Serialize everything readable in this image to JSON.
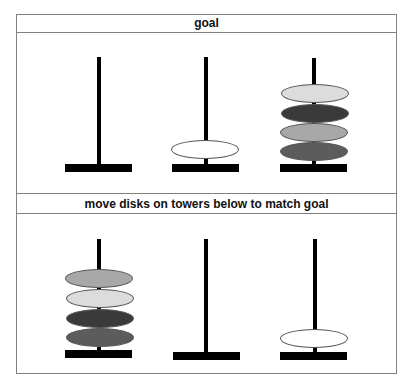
{
  "goal_panel": {
    "title": "goal",
    "towers": [
      {
        "label": "goal-tower-1",
        "disks": []
      },
      {
        "label": "goal-tower-2",
        "disks": [
          {
            "color": "#ffffff",
            "name": "white"
          }
        ]
      },
      {
        "label": "goal-tower-3",
        "disks": [
          {
            "color": "#dcdcdc",
            "name": "light-gray"
          },
          {
            "color": "#3a3a3a",
            "name": "dark-gray"
          },
          {
            "color": "#a8a8a8",
            "name": "medium-gray"
          },
          {
            "color": "#5c5c5c",
            "name": "charcoal"
          }
        ]
      }
    ]
  },
  "play_panel": {
    "title": "move disks on towers below to match goal",
    "towers": [
      {
        "label": "tower-1",
        "disks": [
          {
            "color": "#a8a8a8",
            "name": "medium-gray"
          },
          {
            "color": "#dcdcdc",
            "name": "light-gray"
          },
          {
            "color": "#3a3a3a",
            "name": "dark-gray"
          },
          {
            "color": "#5c5c5c",
            "name": "charcoal"
          }
        ]
      },
      {
        "label": "tower-2",
        "disks": []
      },
      {
        "label": "tower-3",
        "disks": [
          {
            "color": "#ffffff",
            "name": "white"
          }
        ]
      }
    ]
  }
}
